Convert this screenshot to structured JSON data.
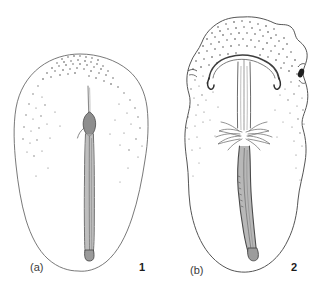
{
  "plate": {
    "title": "Line drawing plate of two stippled ovoid specimens with internal axial structures",
    "background_color": "#ffffff",
    "width": 322,
    "height": 291,
    "outline_color": "#5a5a5a",
    "stipple_color": "#555555",
    "shaft_fill_color": "#8c8c8c",
    "shaft_stroke_color": "#4a4a4a",
    "dark_accent_color": "#1a1a1a"
  },
  "panels": [
    {
      "id": "panel-a",
      "letter": "(a)",
      "number": "1",
      "description": "Ovoid outline with stippled apical field and a slender central axial rod expanding to a small bulb then tapering to a rounded tip",
      "letter_position": {
        "x": 30,
        "y": 262
      },
      "number_position": {
        "x": 139,
        "y": 262
      },
      "outline_bounds": {
        "x": 14,
        "y": 54,
        "width": 132,
        "height": 218
      },
      "features": [
        "stippled apical margin",
        "central axial rod",
        "median bulb swelling",
        "rounded basal tip"
      ]
    },
    {
      "id": "panel-b",
      "letter": "(b)",
      "number": "2",
      "description": "Larger ovoid outline with heavy stippling, an arched hook-tipped capitulum, paired vertical filaments, a feathery lateral collar, and a thick sinuous axial shaft",
      "letter_position": {
        "x": 190,
        "y": 265
      },
      "number_position": {
        "x": 291,
        "y": 262
      },
      "outline_bounds": {
        "x": 184,
        "y": 16,
        "width": 126,
        "height": 256
      },
      "features": [
        "arched capitulum with recurved hooks",
        "paired axial filaments",
        "feathery branched collar",
        "thick sinuous shaft",
        "dark marginal blotch at right edge"
      ]
    }
  ]
}
